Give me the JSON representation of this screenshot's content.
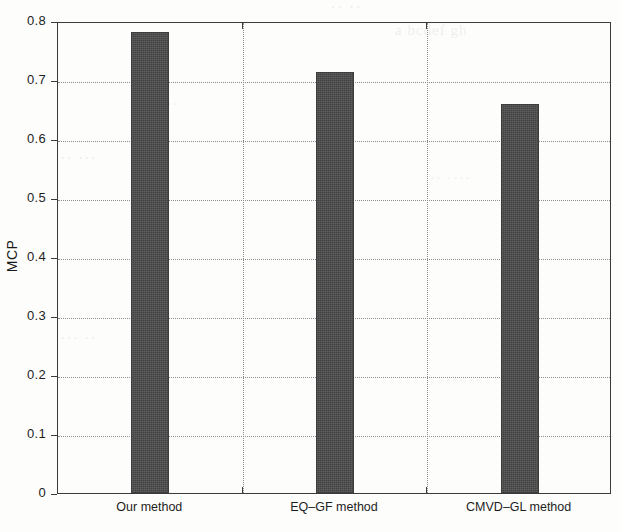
{
  "chart_data": {
    "type": "bar",
    "title": "",
    "subtitle": "",
    "xlabel": "",
    "ylabel": "MCP",
    "categories": [
      "Our method",
      "EQ–GF method",
      "CMVD–GL method"
    ],
    "values": [
      0.781,
      0.714,
      0.659
    ],
    "ylim": [
      0,
      0.8
    ],
    "xlim": [
      0,
      3
    ],
    "ytick_labels": [
      "0",
      "0.1",
      "0.2",
      "0.3",
      "0.4",
      "0.5",
      "0.6",
      "0.7",
      "0.8"
    ],
    "ytick_values": [
      0,
      0.1,
      0.2,
      0.3,
      0.4,
      0.5,
      0.6,
      0.7,
      0.8
    ],
    "xtick_values": [
      1,
      2
    ],
    "grid": true,
    "grid_style": "dotted",
    "legend": null,
    "legend_position": "none",
    "bar_color": "#4b4b4b",
    "axis_color": "#3b3b3b",
    "grid_color": "#8d8d8d",
    "background_color": "#fdfdfc"
  },
  "figure": {
    "ylabel": "MCP",
    "ghost_text": {
      "line1": "·· ··",
      "line2": "a bcdef gh",
      "line3": "·· ···",
      "line4": "·· ····",
      "line5": "··· ··",
      "line6": "···· ··",
      "line7": "·· ··"
    }
  }
}
